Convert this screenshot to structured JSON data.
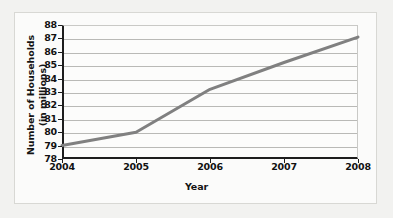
{
  "chart_data": {
    "type": "line",
    "title": "",
    "xlabel": "Year",
    "ylabel_line1": "Number of Households",
    "ylabel_line2": "(in millions)",
    "x": [
      2004,
      2005,
      2006,
      2007,
      2008
    ],
    "xtick_labels": [
      "2004",
      "2005",
      "2006",
      "2007",
      "2008"
    ],
    "ytick_labels": [
      "88",
      "87",
      "86",
      "85",
      "84",
      "83",
      "82",
      "81",
      "80",
      "79",
      "78"
    ],
    "ytick_values": [
      88,
      87,
      86,
      85,
      84,
      83,
      82,
      81,
      80,
      79,
      78
    ],
    "series": [
      {
        "name": "Number of Households",
        "values": [
          79.0,
          80.0,
          83.2,
          85.2,
          87.1
        ]
      }
    ],
    "xlim": [
      2004,
      2008
    ],
    "ylim": [
      78,
      88
    ],
    "grid": true,
    "legend": "none",
    "line_color": "#808080",
    "axis_color": "#1d1d1d",
    "gridline_color": "#b9b9b6",
    "plot_background": "#fcfcfb",
    "page_background": "#f2f2f0"
  }
}
